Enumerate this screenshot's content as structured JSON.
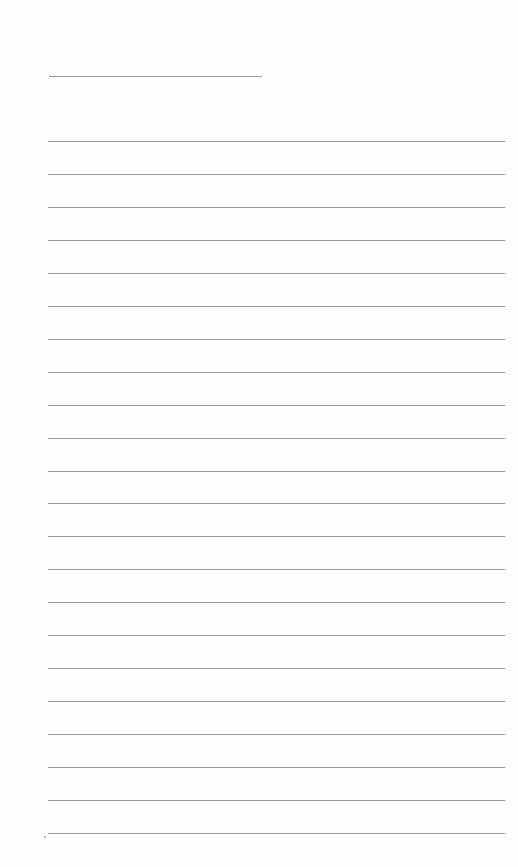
{
  "page": {
    "type": "ruled-writing-sheet",
    "background": "#fefefe",
    "rule_color": "#9a9a9a",
    "header_rule": {
      "x": 49,
      "y": 76,
      "width": 213
    },
    "lines": {
      "x": 48,
      "width": 457,
      "first_y": 141,
      "spacing": 32.95,
      "count": 22
    },
    "text": []
  }
}
